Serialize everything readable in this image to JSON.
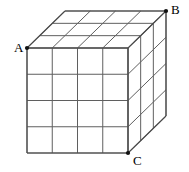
{
  "figure": {
    "type": "geometry-diagram",
    "background_color": "#ffffff",
    "line_color": "#5f5f5f",
    "edge_color": "#4a4a4a",
    "vertex_dot_color": "#111111",
    "label_color": "#000000",
    "grid": {
      "columns": 4,
      "rows": 4,
      "depth": 3
    },
    "projection": {
      "front_left_x": 27,
      "front_top_y": 48,
      "front_right_x": 128,
      "front_bottom_y": 153,
      "depth_dx": 38,
      "depth_dy": -37
    },
    "vertices": [
      {
        "name": "A",
        "label": "A",
        "x": 27,
        "y": 48,
        "label_x": 14,
        "label_y": 41,
        "position": "front-top-left"
      },
      {
        "name": "B",
        "label": "B",
        "x": 166,
        "y": 11,
        "label_x": 171,
        "label_y": 3,
        "position": "back-top-right"
      },
      {
        "name": "C",
        "label": "C",
        "x": 128,
        "y": 153,
        "label_x": 133,
        "label_y": 154,
        "position": "front-bottom-right"
      }
    ]
  }
}
